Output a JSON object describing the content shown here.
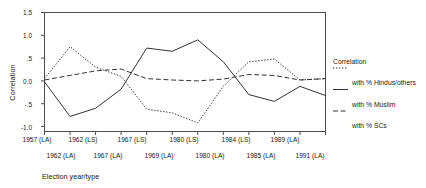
{
  "chart_data": {
    "type": "line",
    "title": "",
    "xlabel": "Election year/type",
    "ylabel": "Correlation",
    "ylim": [
      -1.0,
      1.5
    ],
    "yticks": [
      1.5,
      1.0,
      0.5,
      0.0,
      -0.5,
      -1.0
    ],
    "ytick_labels": [
      "1.5",
      "1.0",
      ".5",
      "0.0",
      "-.5",
      "-1.0"
    ],
    "grid": false,
    "legend_position": "right",
    "legend_title": "Correlation",
    "categories": [
      "1957 (LA)",
      "1962 (LA)",
      "1962 (LS)",
      "1967 (LA)",
      "1967 (LS)",
      "1969 (LA)",
      "1980 (LS)",
      "1980 (LA)",
      "1984 (LS)",
      "1985 (LA)",
      "1989 (LA)",
      "1991 (LA)"
    ],
    "xtick_labels_upper": [
      "1957 (LA)",
      "1962 (LS)",
      "1967 (LS)",
      "1980 (LS)",
      "1984 (LS)",
      "1989 (LA)"
    ],
    "xtick_labels_lower": [
      "1962 (LA)",
      "1967 (LA)",
      "1969 (LA)",
      "1980 (LA)",
      "1985 (LA)",
      "1991 (LA)"
    ],
    "series": [
      {
        "name": "with % Hindus/others",
        "style": "dotted",
        "values": [
          0.05,
          0.75,
          0.3,
          0.1,
          -0.62,
          -0.7,
          -0.92,
          -0.12,
          0.42,
          0.48,
          0.02,
          0.05
        ]
      },
      {
        "name": "with % Muslim",
        "style": "solid",
        "values": [
          -0.02,
          -0.78,
          -0.6,
          -0.18,
          0.72,
          0.65,
          0.9,
          0.42,
          -0.3,
          -0.45,
          -0.12,
          -0.32
        ]
      },
      {
        "name": "with % SCs",
        "style": "dashed",
        "values": [
          0.02,
          0.12,
          0.22,
          0.26,
          0.05,
          0.02,
          0.0,
          0.04,
          0.14,
          0.12,
          0.02,
          0.05
        ]
      }
    ]
  },
  "legend": {
    "title": "Correlation",
    "entries": [
      {
        "label": "with % Hindus/others",
        "style": "dotted"
      },
      {
        "label": "with % Muslim",
        "style": "solid"
      },
      {
        "label": "with % SCs",
        "style": "dashed"
      }
    ]
  },
  "axes": {
    "y_title": "Correlation",
    "x_title": "Election year/type"
  }
}
